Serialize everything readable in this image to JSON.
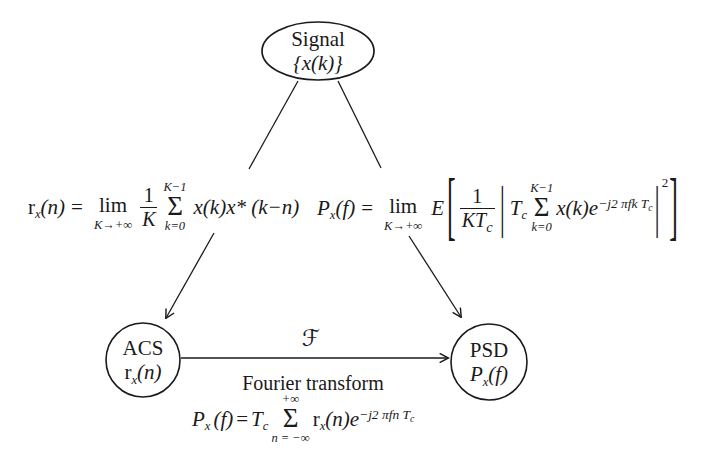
{
  "page": {
    "background": "#ffffff",
    "ink": "#1a1a1a"
  },
  "nodes": {
    "signal": {
      "title": "Signal",
      "symbol": "{x(k)}"
    },
    "acs": {
      "title": "ACS",
      "sym_base": "r",
      "sym_sub": "x",
      "sym_arg": "(n)"
    },
    "psd": {
      "title": "PSD",
      "sym_base": "P",
      "sym_sub": "x",
      "sym_arg": "(f)"
    }
  },
  "formulas": {
    "acs_def": {
      "lhs_base": "r",
      "lhs_sub": "x",
      "lhs_arg": "(n)",
      "equals": "=",
      "lim": "lim",
      "lim_under": "K→+∞",
      "frac_num": "1",
      "frac_den": "K",
      "sum_upper": "K−1",
      "sigma": "Σ",
      "sum_lower": "k=0",
      "body": "x(k)x* (k−n)"
    },
    "psd_def": {
      "lhs_base": "P",
      "lhs_sub": "x",
      "lhs_arg": "(f)",
      "equals": "=",
      "lim": "lim",
      "lim_under": "K→+∞",
      "expectation": "E",
      "lbracket": "[",
      "frac_num": "1",
      "frac_den_main": "KT",
      "frac_den_sub": "c",
      "lbar": "|",
      "coef_main": "T",
      "coef_sub": "c",
      "sum_upper": "K−1",
      "sigma": "Σ",
      "sum_lower": "k=0",
      "body": "x(k)e",
      "exp_main": "−j2 πfk T",
      "exp_sub": "c",
      "rbar": "|",
      "square": "2",
      "rbracket": "]"
    },
    "fourier_def": {
      "operator": "ℱ",
      "caption": "Fourier transform",
      "lhs_base": "P",
      "lhs_sub": "x",
      "lhs_arg": "(f)",
      "equals": "=",
      "coef_main": "T",
      "coef_sub": "c",
      "sum_upper": "+∞",
      "sigma": "Σ",
      "sum_lower": "n = −∞",
      "body_base": "r",
      "body_sub": "x",
      "body_arg": "(n)e",
      "exp_main": "−j2 πfn T",
      "exp_sub": "c"
    }
  }
}
